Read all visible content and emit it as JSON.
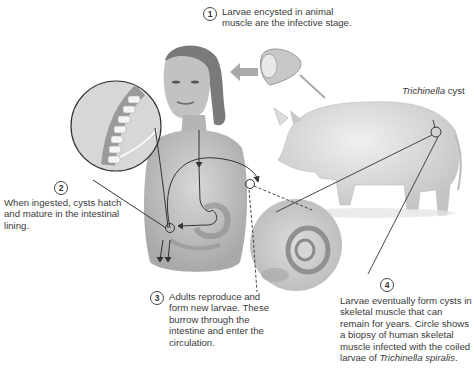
{
  "diagram": {
    "steps": [
      {
        "number": "1",
        "text": "Larvae encysted in animal muscle are the infective stage."
      },
      {
        "number": "2",
        "text": "When ingested, cysts hatch and mature in the intestinal lining."
      },
      {
        "number": "3",
        "text": "Adults reproduce and form new larvae. These burrow through the intestine and enter the circulation."
      },
      {
        "number": "4",
        "text_before": "Larvae eventually form cysts in skeletal muscle that can remain for years. Circle shows a biopsy of human skeletal muscle infected with the coiled larvae of ",
        "text_italic": "Trichinella spiralis",
        "text_after": "."
      }
    ],
    "callouts": {
      "cyst_label_italic": "Trichinella",
      "cyst_label_rest": " cyst"
    },
    "figures": [
      "human-female",
      "pig",
      "meat-cut",
      "intestine-magnified",
      "muscle-biopsy-magnified"
    ]
  }
}
